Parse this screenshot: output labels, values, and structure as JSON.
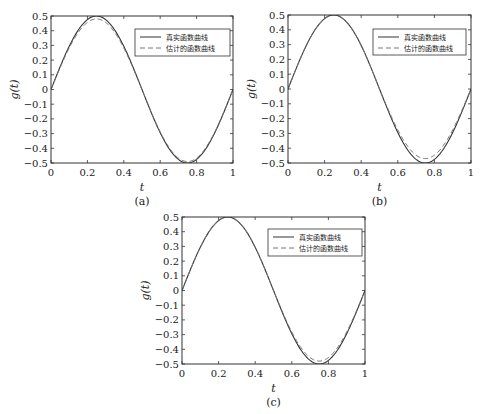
{
  "chart_data": [
    {
      "id": "a",
      "type": "line",
      "caption": "(a)",
      "xlabel": "t",
      "ylabel": "g(t)",
      "xlim": [
        0,
        1
      ],
      "ylim": [
        -0.5,
        0.5
      ],
      "xticks": [
        "0",
        "0.2",
        "0.4",
        "0.6",
        "0.8",
        "1"
      ],
      "yticks": [
        "0.5",
        "0.4",
        "0.3",
        "0.2",
        "0.1",
        "0",
        "−0.1",
        "−0.2",
        "−0.3",
        "−0.4",
        "−0.5"
      ],
      "grid": false,
      "legend_position": "upper right",
      "series": [
        {
          "name": "真实函数曲线",
          "style": "solid",
          "formula": "0.5*sin(2*pi*t)",
          "peak": 0.5,
          "trough": -0.5
        },
        {
          "name": "估计的函数曲线",
          "style": "dashed",
          "formula": "approx 0.5*sin(2*pi*t)",
          "peak": 0.48,
          "trough": -0.49
        }
      ]
    },
    {
      "id": "b",
      "type": "line",
      "caption": "(b)",
      "xlabel": "t",
      "ylabel": "g(t)",
      "xlim": [
        0,
        1
      ],
      "ylim": [
        -0.5,
        0.5
      ],
      "xticks": [
        "0",
        "0.2",
        "0.4",
        "0.6",
        "0.8",
        "1"
      ],
      "yticks": [
        "0.5",
        "0.4",
        "0.3",
        "0.2",
        "0.1",
        "0",
        "−0.1",
        "−0.2",
        "−0.3",
        "−0.4",
        "−0.5"
      ],
      "grid": false,
      "legend_position": "upper right",
      "series": [
        {
          "name": "真实函数曲线",
          "style": "solid",
          "formula": "0.5*sin(2*pi*t)",
          "peak": 0.5,
          "trough": -0.5
        },
        {
          "name": "估计的函数曲线",
          "style": "dashed",
          "formula": "approx 0.5*sin(2*pi*t)",
          "peak": 0.5,
          "trough": -0.47
        }
      ]
    },
    {
      "id": "c",
      "type": "line",
      "caption": "(c)",
      "xlabel": "t",
      "ylabel": "g(t)",
      "xlim": [
        0,
        1
      ],
      "ylim": [
        -0.5,
        0.5
      ],
      "xticks": [
        "0",
        "0.2",
        "0.4",
        "0.6",
        "0.8",
        "1"
      ],
      "yticks": [
        "0.5",
        "0.4",
        "0.3",
        "0.2",
        "0.1",
        "0",
        "−0.1",
        "−0.2",
        "−0.3",
        "−0.4",
        "−0.5"
      ],
      "grid": false,
      "legend_position": "upper right",
      "series": [
        {
          "name": "真实函数曲线",
          "style": "solid",
          "formula": "0.5*sin(2*pi*t)",
          "peak": 0.5,
          "trough": -0.5
        },
        {
          "name": "估计的函数曲线",
          "style": "dashed",
          "formula": "approx 0.5*sin(2*pi*t)",
          "peak": 0.5,
          "trough": -0.48
        }
      ]
    }
  ],
  "panels": [
    {
      "frame": {
        "x": 51,
        "y": 16,
        "w": 182,
        "h": 147
      },
      "legend": {
        "x": 135,
        "y": 29,
        "w": 95,
        "h": 27
      }
    },
    {
      "frame": {
        "x": 288,
        "y": 15,
        "w": 183,
        "h": 148
      },
      "legend": {
        "x": 373,
        "y": 29,
        "w": 93,
        "h": 26
      }
    },
    {
      "frame": {
        "x": 182,
        "y": 217,
        "w": 183,
        "h": 147
      },
      "legend": {
        "x": 268,
        "y": 229,
        "w": 94,
        "h": 27
      }
    }
  ]
}
